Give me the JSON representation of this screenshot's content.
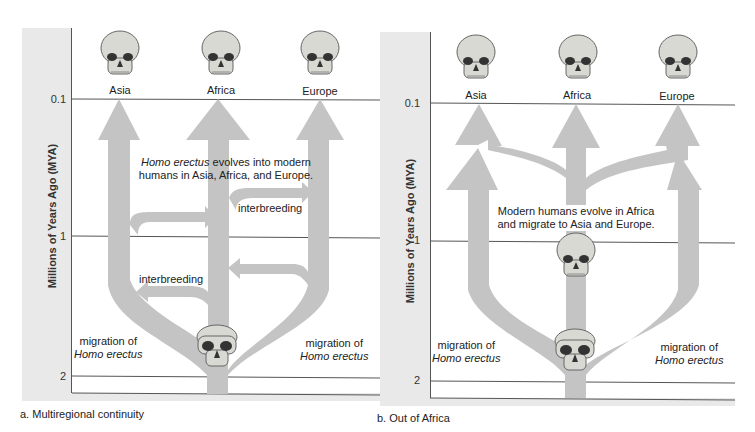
{
  "colors": {
    "band": "#e9e9e9",
    "arrow": "#c4c4c4",
    "line": "#555555",
    "skull": "#d9d9d3"
  },
  "panel_a": {
    "caption": "a. Multiregional continuity",
    "axis_label": "Millions of Years Ago (MYA)",
    "ticks": [
      "0.1",
      "1",
      "2"
    ],
    "regions": [
      "Asia",
      "Africa",
      "Europe"
    ],
    "note_italic": "Homo erectus",
    "note_rest_line1": " evolves into modern",
    "note_line2": "humans in Asia, Africa, and Europe.",
    "interbreeding_upper": "interbreeding",
    "interbreeding_lower": "interbreeding",
    "migration_left_line1": "migration of",
    "migration_left_line2": "Homo erectus",
    "migration_right_line1": "migration of",
    "migration_right_line2": "Homo erectus",
    "icons": {
      "top_skulls": [
        "skull-icon-asia",
        "skull-icon-africa",
        "skull-icon-europe"
      ],
      "origin_skull": "homo-erectus-skull-icon"
    }
  },
  "panel_b": {
    "caption": "b. Out of Africa",
    "axis_label": "Millions of Years Ago (MYA)",
    "ticks": [
      "0.1",
      "1",
      "2"
    ],
    "regions": [
      "Asia",
      "Africa",
      "Europe"
    ],
    "note_line1": "Modern humans evolve in Africa",
    "note_line2": "and migrate to Asia and Europe.",
    "migration_left_line1": "migration of",
    "migration_left_line2": "Homo erectus",
    "migration_right_line1": "migration of",
    "migration_right_line2": "Homo erectus",
    "icons": {
      "top_skulls": [
        "skull-icon-asia",
        "skull-icon-africa",
        "skull-icon-europe"
      ],
      "modern_skull": "modern-human-skull-icon",
      "origin_skull": "homo-erectus-skull-icon"
    }
  }
}
